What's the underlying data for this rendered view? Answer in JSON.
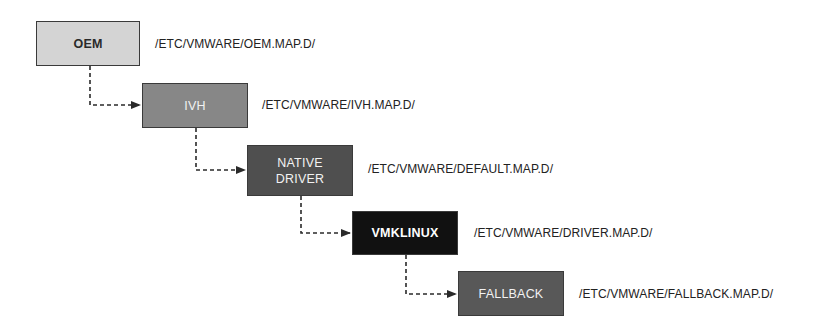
{
  "diagram": {
    "type": "driver-map-priority-hierarchy",
    "nodes": [
      {
        "id": "oem",
        "label": "OEM",
        "lines": [
          "OEM"
        ],
        "path": "/ETC/VMWARE/OEM.MAP.D/",
        "fill": "#d4d4d4",
        "text_color": "#2a2a2a"
      },
      {
        "id": "ivh",
        "label": "IVH",
        "lines": [
          "IVH"
        ],
        "path": "/ETC/VMWARE/IVH.MAP.D/",
        "fill": "#878787",
        "text_color": "#f2f2f2"
      },
      {
        "id": "native",
        "label": "NATIVE DRIVER",
        "lines": [
          "NATIVE",
          "DRIVER"
        ],
        "path": "/ETC/VMWARE/DEFAULT.MAP.D/",
        "fill": "#4f4f4f",
        "text_color": "#f2f2f2"
      },
      {
        "id": "vmklinux",
        "label": "VMKLINUX",
        "lines": [
          "VMKLINUX"
        ],
        "path": "/ETC/VMWARE/DRIVER.MAP.D/",
        "fill": "#111111",
        "text_color": "#ffffff"
      },
      {
        "id": "fallback",
        "label": "FALLBACK",
        "lines": [
          "FALLBACK"
        ],
        "path": "/ETC/VMWARE/FALLBACK.MAP.D/",
        "fill": "#585858",
        "text_color": "#f2f2f2"
      }
    ],
    "edges": [
      {
        "from": "oem",
        "to": "ivh",
        "style": "dashed-arrow"
      },
      {
        "from": "ivh",
        "to": "native",
        "style": "dashed-arrow"
      },
      {
        "from": "native",
        "to": "vmklinux",
        "style": "dashed-arrow"
      },
      {
        "from": "vmklinux",
        "to": "fallback",
        "style": "dashed-arrow"
      }
    ]
  }
}
